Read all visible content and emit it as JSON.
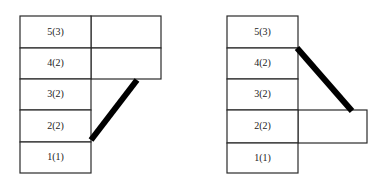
{
  "diagrams": [
    {
      "name": "left-stack",
      "cells": [
        {
          "label": "5(3)",
          "x": 20,
          "y": 16,
          "w": 71,
          "h": 32
        },
        {
          "label": "4(2)",
          "x": 20,
          "y": 48,
          "w": 71,
          "h": 31
        },
        {
          "label": "3(2)",
          "x": 20,
          "y": 79,
          "w": 71,
          "h": 31
        },
        {
          "label": "2(2)",
          "x": 20,
          "y": 110,
          "w": 71,
          "h": 32
        },
        {
          "label": "1(1)",
          "x": 20,
          "y": 142,
          "w": 71,
          "h": 31
        }
      ],
      "side_cells": [
        {
          "label": "",
          "x": 91,
          "y": 16,
          "w": 70,
          "h": 32
        },
        {
          "label": "",
          "x": 91,
          "y": 48,
          "w": 70,
          "h": 31
        }
      ],
      "bar": {
        "x1": 91,
        "y1": 140,
        "x2": 137,
        "y2": 80
      }
    },
    {
      "name": "right-stack",
      "cells": [
        {
          "label": "5(3)",
          "x": 227,
          "y": 16,
          "w": 71,
          "h": 32
        },
        {
          "label": "4(2)",
          "x": 227,
          "y": 48,
          "w": 71,
          "h": 31
        },
        {
          "label": "3(2)",
          "x": 227,
          "y": 79,
          "w": 71,
          "h": 31
        },
        {
          "label": "2(2)",
          "x": 227,
          "y": 110,
          "w": 71,
          "h": 33
        },
        {
          "label": "1(1)",
          "x": 227,
          "y": 143,
          "w": 71,
          "h": 30
        }
      ],
      "side_cells": [
        {
          "label": "",
          "x": 298,
          "y": 110,
          "w": 69,
          "h": 33
        }
      ],
      "bar": {
        "x1": 297,
        "y1": 48,
        "x2": 352,
        "y2": 111
      }
    }
  ]
}
